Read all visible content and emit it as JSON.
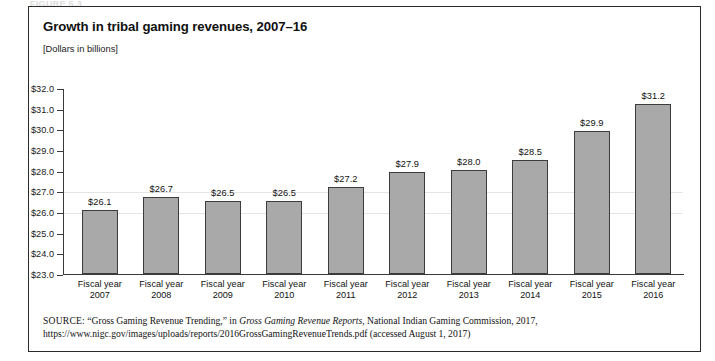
{
  "figure": {
    "cut_label": "FIGURE 5.3",
    "title": "Growth in tribal gaming revenues, 2007–16",
    "subtitle": "[Dollars in billions]"
  },
  "chart_data": {
    "type": "bar",
    "title": "Growth in tribal gaming revenues, 2007–16",
    "subtitle": "[Dollars in billions]",
    "xlabel": "",
    "ylabel": "",
    "ylim": [
      23.0,
      32.0
    ],
    "grid": false,
    "legend": "none",
    "categories": [
      "Fiscal year 2007",
      "Fiscal year 2008",
      "Fiscal year 2009",
      "Fiscal year 2010",
      "Fiscal year 2011",
      "Fiscal year 2012",
      "Fiscal year 2013",
      "Fiscal year 2014",
      "Fiscal year 2015",
      "Fiscal year 2016"
    ],
    "category_lines": [
      [
        "Fiscal year",
        "2007"
      ],
      [
        "Fiscal year",
        "2008"
      ],
      [
        "Fiscal year",
        "2009"
      ],
      [
        "Fiscal year",
        "2010"
      ],
      [
        "Fiscal year",
        "2011"
      ],
      [
        "Fiscal year",
        "2012"
      ],
      [
        "Fiscal year",
        "2013"
      ],
      [
        "Fiscal year",
        "2014"
      ],
      [
        "Fiscal year",
        "2015"
      ],
      [
        "Fiscal year",
        "2016"
      ]
    ],
    "values": [
      26.1,
      26.7,
      26.5,
      26.5,
      27.2,
      27.9,
      28.0,
      28.5,
      29.9,
      31.2
    ],
    "value_labels": [
      "$26.1",
      "$26.7",
      "$26.5",
      "$26.5",
      "$27.2",
      "$27.9",
      "$28.0",
      "$28.5",
      "$29.9",
      "$31.2"
    ],
    "ytick_values": [
      32.0,
      31.0,
      30.0,
      29.0,
      28.0,
      27.0,
      26.0,
      25.0,
      24.0,
      23.0
    ],
    "ytick_labels": [
      "$32.0",
      "$31.0",
      "$30.0",
      "$29.0",
      "$28.0",
      "$27.0",
      "$26.0",
      "$25.0",
      "$24.0",
      "$23.0"
    ],
    "bar_color": "#a9a9a9",
    "bar_border_color": "#3c3c3c"
  },
  "source": {
    "label": "SOURCE:",
    "part1": " “Gross Gaming Revenue Trending,” in ",
    "italic1": "Gross Gaming Revenue Reports",
    "part2": ", National Indian Gaming Commission, 2017, https://www.nigc.gov/images/uploads/reports/2016GrossGamingRevenueTrends.pdf (accessed August 1, 2017)"
  }
}
